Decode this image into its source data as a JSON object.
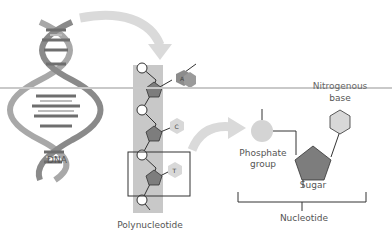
{
  "diagram": {
    "labels": {
      "dna": "DNA",
      "polynucleotide": "Polynucleotide",
      "nitrogenous_base_line1": "Nitrogenous",
      "nitrogenous_base_line2": "base",
      "phosphate_line1": "Phosphate",
      "phosphate_line2": "group",
      "sugar": "Sugar",
      "nucleotide": "Nucleotide"
    },
    "bases": [
      "A",
      "C",
      "T"
    ],
    "colors": {
      "band": "#c8c8c8",
      "pentagon": "#7d7d7d",
      "hexagon": "#d8d8d8",
      "hexagon_a": "#8c8c8c",
      "phosphate": "#d4d4d4",
      "arrow": "#d9d9d9",
      "line": "#333333"
    }
  }
}
